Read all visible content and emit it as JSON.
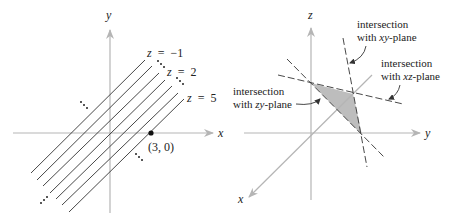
{
  "left_panel": {
    "axes": {
      "x_label": "x",
      "y_label": "y"
    },
    "level_labels": [
      {
        "var": "z",
        "eq": "=",
        "val": "−1"
      },
      {
        "var": "z",
        "eq": "=",
        "val": "2"
      },
      {
        "var": "z",
        "eq": "=",
        "val": "5"
      }
    ],
    "point_label": "(3, 0)",
    "line_count": 7
  },
  "right_panel": {
    "axes": {
      "x_label": "x",
      "y_label": "y",
      "z_label": "z"
    },
    "annotations": {
      "xy": {
        "line1": "intersection",
        "pre": "with ",
        "var": "xy",
        "post": "-plane"
      },
      "xz": {
        "line1": "intersection",
        "pre": "with ",
        "var": "xz",
        "post": "-plane"
      },
      "zy": {
        "line1": "intersection",
        "pre": "with ",
        "var": "zy",
        "post": "-plane"
      }
    }
  },
  "colors": {
    "axis": "#b5b5b5",
    "line": "#333333",
    "fill": "#bdbdbd"
  }
}
